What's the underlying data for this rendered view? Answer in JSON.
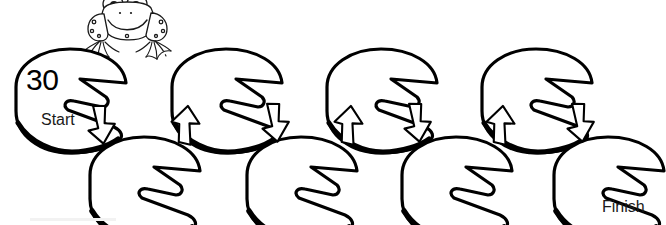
{
  "worksheet": {
    "title": "Lily Pad Counting Path",
    "start_label": "Start",
    "finish_label": "Finish",
    "start_number": "30",
    "line_color": "#000000",
    "fill_color": "#ffffff",
    "background_color": "#ffffff"
  },
  "frog": {
    "name": "cartoon-frog",
    "position": "above-start-pad"
  },
  "pads": {
    "top_row": [
      {
        "label": "30",
        "has_number": true
      },
      {
        "label": "",
        "has_number": false
      },
      {
        "label": "",
        "has_number": false
      },
      {
        "label": "",
        "has_number": false
      }
    ],
    "bottom_row": [
      {
        "label": "",
        "has_number": false
      },
      {
        "label": "",
        "has_number": false
      },
      {
        "label": "",
        "has_number": false
      },
      {
        "label": "",
        "has_number": false
      }
    ]
  },
  "arrows": [
    {
      "direction": "down",
      "icon": "arrow-down-icon"
    },
    {
      "direction": "up",
      "icon": "arrow-up-icon"
    },
    {
      "direction": "down",
      "icon": "arrow-down-icon"
    },
    {
      "direction": "up",
      "icon": "arrow-up-icon"
    },
    {
      "direction": "down",
      "icon": "arrow-down-icon"
    },
    {
      "direction": "up",
      "icon": "arrow-up-icon"
    },
    {
      "direction": "down",
      "icon": "arrow-down-icon"
    }
  ]
}
